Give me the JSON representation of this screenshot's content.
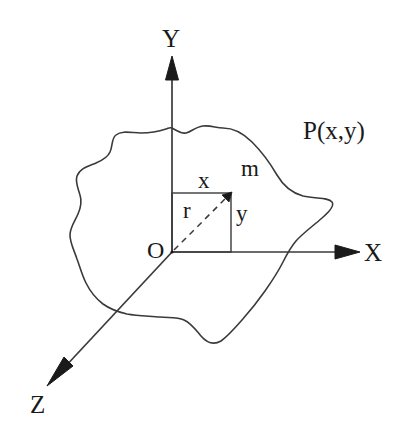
{
  "figure": {
    "type": "diagram",
    "background_color": "#ffffff",
    "stroke_color": "#2b2b2b",
    "text_color": "#1a1a1a"
  },
  "axes": [
    {
      "id": "y-axis",
      "label": "Y",
      "direction": "up",
      "label_position": {
        "x": 162,
        "y": 26
      },
      "line": {
        "x1": 172,
        "y1": 57,
        "x2": 172,
        "y2": 252
      },
      "arrow": "solid-triangle"
    },
    {
      "id": "x-axis",
      "label": "X",
      "direction": "right",
      "label_position": {
        "x": 364,
        "y": 240
      },
      "line": {
        "x1": 172,
        "y1": 252,
        "x2": 360,
        "y2": 252
      },
      "arrow": "solid-triangle"
    },
    {
      "id": "z-axis",
      "label": "Z",
      "direction": "down-left",
      "label_position": {
        "x": 30,
        "y": 392
      },
      "line": {
        "x1": 172,
        "y1": 252,
        "x2": 47,
        "y2": 386
      },
      "arrow": "solid-triangle"
    }
  ],
  "origin": {
    "label": "O",
    "label_position": {
      "x": 147,
      "y": 238
    },
    "point": {
      "x": 172,
      "y": 252
    }
  },
  "point": {
    "label": "P(x,y)",
    "label_position": {
      "x": 303,
      "y": 118
    },
    "coordinates": {
      "x": 231,
      "y": 193
    }
  },
  "mass": {
    "label": "m",
    "label_position": {
      "x": 241,
      "y": 157
    }
  },
  "components": [
    {
      "id": "x-component",
      "label": "x",
      "label_position": {
        "x": 198,
        "y": 169
      },
      "description": "horizontal component, top edge of rectangle"
    },
    {
      "id": "y-component",
      "label": "y",
      "label_position": {
        "x": 236,
        "y": 202
      },
      "description": "vertical component, right edge of rectangle"
    },
    {
      "id": "r-radius",
      "label": "r",
      "label_position": {
        "x": 183,
        "y": 199
      },
      "description": "dashed radius vector from origin to P"
    }
  ],
  "rectangle": {
    "left": 172,
    "top": 193,
    "right": 231,
    "bottom": 252,
    "stroke": "#3a3a3a",
    "style": "solid"
  },
  "radius_vector": {
    "from": {
      "x": 172,
      "y": 252
    },
    "to": {
      "x": 231,
      "y": 193
    },
    "style": "dashed",
    "arrow": "small-triangle"
  },
  "blob": {
    "description": "irregular closed lamina outline lying in the XY-plane",
    "stroke": "#3a3a3a",
    "fill": "none"
  }
}
